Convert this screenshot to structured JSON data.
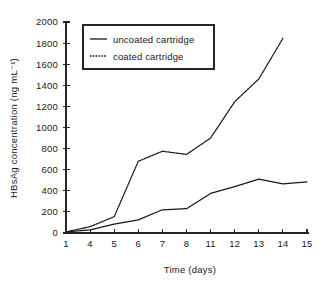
{
  "chart_data": {
    "type": "line",
    "title": "",
    "xlabel": "Time (days)",
    "ylabel": "HBsAg concentration (ng mL⁻¹)",
    "categories": [
      "1",
      "4",
      "5",
      "6",
      "7",
      "8",
      "11",
      "12",
      "13",
      "14",
      "15"
    ],
    "xtick_labels": [
      "1",
      "4",
      "5",
      "6",
      "7",
      "8",
      "11",
      "12",
      "13",
      "14",
      "15"
    ],
    "ytick_labels": [
      "0",
      "200",
      "400",
      "600",
      "800",
      "1000",
      "1200",
      "1400",
      "1600",
      "1800",
      "2000"
    ],
    "ytick_values": [
      0,
      200,
      400,
      600,
      800,
      1000,
      1200,
      1400,
      1600,
      1800,
      2000
    ],
    "ylim": [
      0,
      2000
    ],
    "grid": false,
    "legend_position": "upper-left",
    "series": [
      {
        "name": "uncoated cartridge",
        "style": "solid",
        "color": "#1a1a1a",
        "x": [
          "1",
          "4",
          "5",
          "6",
          "7",
          "8",
          "11",
          "12",
          "13",
          "14",
          "15"
        ],
        "values": [
          10,
          30,
          85,
          125,
          220,
          230,
          375,
          440,
          510,
          465,
          485
        ]
      },
      {
        "name": "coated cartridge",
        "style": "dotted",
        "color": "#1a1a1a",
        "x": [
          "1",
          "4",
          "5",
          "6",
          "7",
          "8",
          "11",
          "12",
          "13",
          "14"
        ],
        "values": [
          10,
          60,
          155,
          680,
          775,
          745,
          900,
          1245,
          1460,
          1845
        ]
      }
    ]
  },
  "legend": {
    "entries": [
      {
        "label": "uncoated cartridge",
        "style": "solid"
      },
      {
        "label": "coated cartridge",
        "style": "dotted"
      }
    ]
  },
  "colors": {
    "ink": "#1a1a1a",
    "axis": "#262626",
    "background": "#ffffff"
  }
}
